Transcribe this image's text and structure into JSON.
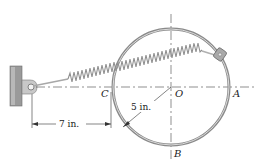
{
  "figure": {
    "labels": {
      "C": "C",
      "O": "O",
      "A": "A",
      "B": "B"
    },
    "dimensions": {
      "radius": "5 in.",
      "offset": "7 in."
    }
  },
  "colors": {
    "ring": "#8a8a8a",
    "ring_highlight": "#d6d6d6",
    "spring": "#9a9a9a",
    "wall": "#8c8c8c",
    "line": "#333333",
    "text": "#222222"
  }
}
